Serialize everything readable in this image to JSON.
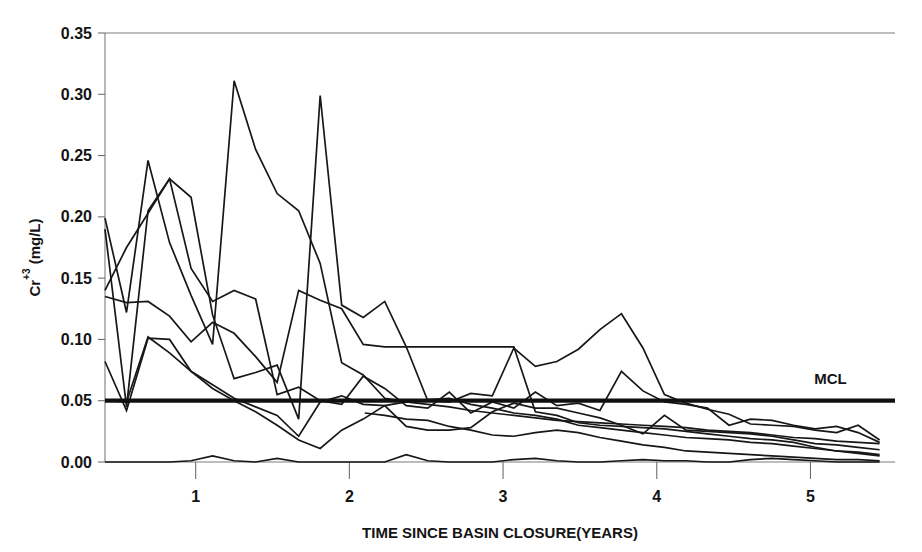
{
  "chart_data": {
    "type": "line",
    "title": "",
    "xlabel": "TIME SINCE BASIN CLOSURE(YEARS)",
    "ylabel": "Cr+3 (mg/L)",
    "ylabel_base": "Cr",
    "ylabel_sup": "+3",
    "ylabel_units": " (mg/L)",
    "xlim": [
      0.41,
      5.55
    ],
    "ylim": [
      0.0,
      0.35
    ],
    "grid": false,
    "legend": false,
    "xticks": [
      1,
      2,
      3,
      4,
      5
    ],
    "xtick_labels": [
      "1",
      "2",
      "3",
      "4",
      "5"
    ],
    "yticks": [
      0.0,
      0.05,
      0.1,
      0.15,
      0.2,
      0.25,
      0.3,
      0.35
    ],
    "ytick_labels": [
      "0.00",
      "0.05",
      "0.10",
      "0.15",
      "0.20",
      "0.25",
      "0.30",
      "0.35"
    ],
    "annotations": [
      {
        "text": "MCL",
        "x": 5.13,
        "y": 0.064,
        "kind": "threshold-label"
      }
    ],
    "threshold": {
      "name": "MCL",
      "value": 0.05,
      "x_start": 0.41,
      "x_end": 5.55,
      "style": "thick-solid",
      "color": "#101010"
    },
    "series": [
      {
        "name": "Well 1",
        "color": "#171717",
        "x": [
          0.41,
          0.55,
          0.69,
          0.83,
          0.97,
          1.11,
          1.25,
          1.39,
          1.53,
          1.67,
          1.81,
          1.95,
          2.09,
          2.23,
          2.37,
          2.51,
          2.65,
          2.79,
          2.93,
          3.07,
          3.21,
          3.35,
          3.49,
          3.63,
          3.77,
          3.91,
          4.05,
          4.19,
          4.33,
          4.47,
          4.61,
          4.75,
          4.89,
          5.03,
          5.17,
          5.31,
          5.45
        ],
        "y": [
          0.199,
          0.122,
          0.246,
          0.179,
          0.136,
          0.096,
          0.311,
          0.255,
          0.219,
          0.205,
          0.162,
          0.081,
          0.071,
          0.052,
          0.049,
          0.047,
          0.045,
          0.042,
          0.04,
          0.038,
          0.036,
          0.034,
          0.033,
          0.032,
          0.031,
          0.03,
          0.029,
          0.028,
          0.026,
          0.025,
          0.024,
          0.022,
          0.02,
          0.019,
          0.017,
          0.016,
          0.015
        ]
      },
      {
        "name": "Well 2",
        "color": "#171717",
        "x": [
          0.41,
          0.55,
          0.69,
          0.83,
          0.97,
          1.11,
          1.25,
          1.39,
          1.53,
          1.67,
          1.81,
          1.95,
          2.09,
          2.23,
          2.37,
          2.51,
          2.65,
          2.79,
          2.93,
          3.07,
          3.21,
          3.35,
          3.49,
          3.63,
          3.77,
          3.91,
          4.05,
          4.19,
          4.33,
          4.47,
          4.61,
          4.75,
          4.89,
          5.03,
          5.17,
          5.31,
          5.45
        ],
        "y": [
          0.19,
          0.045,
          0.205,
          0.231,
          0.216,
          0.12,
          0.068,
          0.073,
          0.079,
          0.035,
          0.299,
          0.128,
          0.118,
          0.131,
          0.094,
          0.05,
          0.049,
          0.056,
          0.054,
          0.093,
          0.078,
          0.082,
          0.092,
          0.108,
          0.121,
          0.093,
          0.055,
          0.048,
          0.043,
          0.039,
          0.031,
          0.03,
          0.029,
          0.026,
          0.024,
          0.03,
          0.018
        ]
      },
      {
        "name": "Well 3",
        "color": "#171717",
        "x": [
          0.41,
          0.55,
          0.69,
          0.83,
          0.97,
          1.11,
          1.25,
          1.39,
          1.53,
          1.67,
          1.81,
          1.95,
          2.09,
          2.23,
          2.37,
          2.51,
          2.65,
          2.79,
          2.93,
          3.07,
          3.21,
          3.35,
          3.49,
          3.63,
          3.77,
          3.91,
          4.05,
          4.19,
          4.33,
          4.47,
          4.61,
          4.75,
          4.89,
          5.03,
          5.17,
          5.31,
          5.45
        ],
        "y": [
          0.14,
          0.175,
          0.203,
          0.231,
          0.158,
          0.131,
          0.14,
          0.133,
          0.055,
          0.061,
          0.05,
          0.047,
          0.07,
          0.06,
          0.046,
          0.044,
          0.057,
          0.04,
          0.049,
          0.044,
          0.057,
          0.046,
          0.048,
          0.042,
          0.074,
          0.058,
          0.049,
          0.047,
          0.044,
          0.03,
          0.035,
          0.034,
          0.03,
          0.027,
          0.029,
          0.024,
          0.016
        ]
      },
      {
        "name": "Well 4",
        "color": "#171717",
        "x": [
          0.41,
          0.55,
          0.69,
          0.83,
          0.97,
          1.11,
          1.25,
          1.39,
          1.53,
          1.67,
          1.81,
          1.95,
          2.09,
          2.23,
          2.37,
          2.51,
          2.65,
          2.79,
          2.93,
          3.07,
          3.21,
          3.35,
          3.49,
          3.63,
          3.77,
          3.91,
          4.05,
          4.19,
          4.33,
          4.47,
          4.61,
          4.75,
          4.89,
          5.03,
          5.17,
          5.31,
          5.45
        ],
        "y": [
          0.135,
          0.13,
          0.131,
          0.119,
          0.098,
          0.114,
          0.105,
          0.086,
          0.065,
          0.14,
          0.132,
          0.125,
          0.096,
          0.094,
          0.094,
          0.094,
          0.094,
          0.094,
          0.094,
          0.094,
          0.041,
          0.038,
          0.032,
          0.03,
          0.029,
          0.028,
          0.027,
          0.025,
          0.023,
          0.021,
          0.019,
          0.018,
          0.016,
          0.012,
          0.009,
          0.007,
          0.005
        ]
      },
      {
        "name": "Well 5",
        "color": "#171717",
        "x": [
          0.41,
          0.55,
          0.69,
          0.83,
          0.97,
          1.11,
          1.25,
          1.39,
          1.53,
          1.67,
          1.81,
          1.95,
          2.09,
          2.23,
          2.37,
          2.51,
          2.65,
          2.79,
          2.93,
          3.07,
          3.21,
          3.35,
          3.49,
          3.63,
          3.77,
          3.91,
          4.05,
          4.19,
          4.33,
          4.47,
          4.61,
          4.75,
          4.89,
          5.03,
          5.17,
          5.31,
          5.45
        ],
        "y": [
          0.082,
          0.042,
          0.101,
          0.1,
          0.074,
          0.063,
          0.052,
          0.045,
          0.038,
          0.021,
          0.049,
          0.054,
          0.047,
          0.046,
          0.029,
          0.026,
          0.026,
          0.028,
          0.041,
          0.048,
          0.044,
          0.044,
          0.04,
          0.036,
          0.03,
          0.023,
          0.038,
          0.026,
          0.025,
          0.024,
          0.023,
          0.021,
          0.018,
          0.015,
          0.014,
          0.012,
          0.01
        ]
      },
      {
        "name": "Well 6",
        "color": "#171717",
        "x": [
          0.41,
          0.55,
          0.69,
          0.83,
          0.97,
          1.11,
          1.25,
          1.39,
          1.53,
          1.67,
          1.81,
          1.95,
          2.09,
          2.23,
          2.37,
          2.51,
          2.65,
          2.79,
          2.93,
          3.07,
          3.21,
          3.35,
          3.49,
          3.63,
          3.77,
          3.91,
          4.05,
          4.19,
          4.33,
          4.47,
          4.61,
          4.75,
          4.89,
          5.03,
          5.17,
          5.31,
          5.45
        ],
        "y": [
          0.05,
          0.049,
          0.102,
          0.089,
          0.074,
          0.06,
          0.05,
          0.041,
          0.03,
          0.018,
          0.011,
          0.026,
          0.035,
          0.046,
          0.049,
          0.051,
          0.052,
          0.047,
          0.044,
          0.04,
          0.038,
          0.035,
          0.03,
          0.028,
          0.026,
          0.024,
          0.022,
          0.02,
          0.019,
          0.018,
          0.016,
          0.015,
          0.013,
          0.011,
          0.009,
          0.008,
          0.006
        ]
      },
      {
        "name": "Well 7",
        "color": "#171717",
        "x": [
          0.41,
          0.55,
          0.69,
          0.83,
          0.97,
          1.11,
          1.25,
          1.39,
          1.53,
          1.67,
          1.81,
          1.95,
          2.09,
          2.23,
          2.37,
          2.51,
          2.65,
          2.79,
          2.93,
          3.07,
          3.21,
          3.35,
          3.49,
          3.63,
          3.77,
          3.91,
          4.05,
          4.19,
          4.33,
          4.47,
          4.61,
          4.75,
          4.89,
          5.03,
          5.17,
          5.31,
          5.45
        ],
        "y": [
          0.0,
          0.0,
          0.0,
          0.0,
          0.001,
          0.005,
          0.001,
          0.0,
          0.003,
          0.0,
          0.0,
          0.0,
          0.0,
          0.0,
          0.006,
          0.001,
          0.0,
          0.0,
          0.0,
          0.002,
          0.003,
          0.001,
          0.0,
          0.0,
          0.001,
          0.002,
          0.001,
          0.001,
          0.0,
          0.0,
          0.002,
          0.003,
          0.002,
          0.001,
          0.0,
          0.0,
          0.0
        ]
      },
      {
        "name": "Well 8",
        "color": "#171717",
        "x": [
          2.1,
          2.23,
          2.37,
          2.51,
          2.65,
          2.79,
          2.93,
          3.07,
          3.21,
          3.35,
          3.49,
          3.63,
          3.77,
          3.91,
          4.05,
          4.19,
          4.33,
          4.47,
          4.61,
          4.75,
          4.89,
          5.03,
          5.17,
          5.31,
          5.45
        ],
        "y": [
          0.04,
          0.038,
          0.035,
          0.034,
          0.029,
          0.026,
          0.022,
          0.021,
          0.024,
          0.026,
          0.024,
          0.02,
          0.017,
          0.014,
          0.012,
          0.009,
          0.008,
          0.007,
          0.006,
          0.005,
          0.004,
          0.003,
          0.002,
          0.002,
          0.001
        ]
      }
    ]
  },
  "plot_geometry": {
    "left_px": 105,
    "right_px": 895,
    "top_px": 33,
    "bottom_px": 462
  }
}
